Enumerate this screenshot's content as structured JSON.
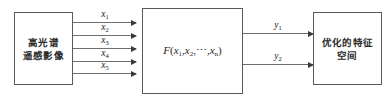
{
  "diagram": {
    "type": "block-flow",
    "width": 392,
    "height": 102,
    "background_color": "#ffffff",
    "border_color": "#5a5a5a",
    "arrow_color": "#6e6e6e",
    "text_color": "#2b2b2b"
  },
  "blocks": {
    "source": {
      "label": "高光谱\n遥感影像",
      "line1": "高光谱",
      "line2": "遥感影像"
    },
    "function": {
      "name": "F",
      "open_paren": "(",
      "arg1": "x",
      "arg1_sub": "1",
      "comma1": ",",
      "arg2": "x",
      "arg2_sub": "2",
      "comma2": ",",
      "ellipsis": "⋯",
      "comma3": ",",
      "argn": "x",
      "argn_sub": "n",
      "close_paren": ")",
      "full_text": "F(x₁,x₂,⋯,xₙ)"
    },
    "target": {
      "label": "优化的特征\n空间",
      "line1": "优化的特征",
      "line2": "空间"
    }
  },
  "inputs": [
    {
      "symbol": "x",
      "subscript": "1",
      "label": "x₁",
      "y": 22
    },
    {
      "symbol": "x",
      "subscript": "2",
      "label": "x₂",
      "y": 35
    },
    {
      "symbol": "x",
      "subscript": "3",
      "label": "x₃",
      "y": 48
    },
    {
      "symbol": "x",
      "subscript": "4",
      "label": "x₄",
      "y": 61
    },
    {
      "symbol": "x",
      "subscript": "5",
      "label": "x₅",
      "y": 73
    }
  ],
  "outputs": [
    {
      "symbol": "y",
      "subscript": "1",
      "label": "y₁",
      "y": 33
    },
    {
      "symbol": "y",
      "subscript": "2",
      "label": "y₂",
      "y": 64
    }
  ]
}
